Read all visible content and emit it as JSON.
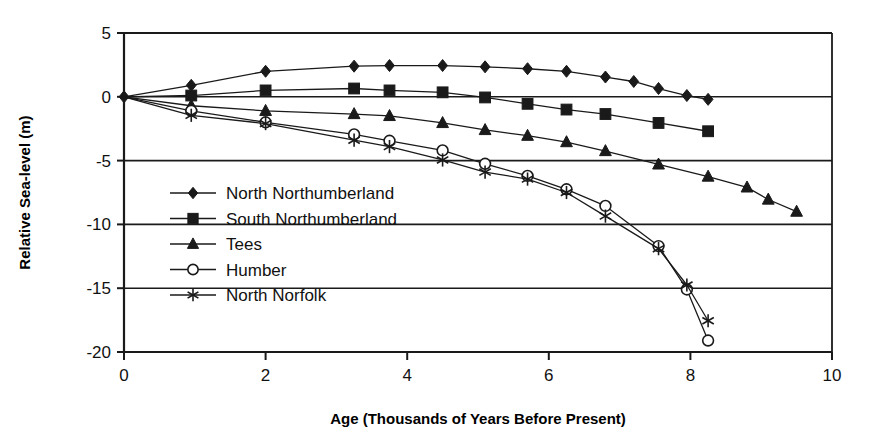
{
  "chart_data": {
    "type": "line",
    "title": "",
    "xlabel": "Age (Thousands of Years Before Present)",
    "ylabel": "Relative Sea-level (m)",
    "xlim": [
      0,
      10
    ],
    "ylim": [
      -20,
      5
    ],
    "xticks": [
      0,
      2,
      4,
      6,
      8,
      10
    ],
    "yticks": [
      5,
      0,
      -5,
      -10,
      -15,
      -20
    ],
    "xtick_labels": [
      "0",
      "2",
      "4",
      "6",
      "8",
      "10"
    ],
    "ytick_labels": [
      "5",
      "0",
      "-5",
      "-10",
      "-15",
      "-20"
    ],
    "grid": "horizontal",
    "legend_position": "inside-left",
    "series": [
      {
        "name": "North Northumberland",
        "marker": "filled-diamond",
        "points": [
          [
            0.0,
            0.0
          ],
          [
            0.95,
            0.9
          ],
          [
            2.0,
            2.0
          ],
          [
            3.25,
            2.4
          ],
          [
            3.75,
            2.45
          ],
          [
            4.5,
            2.45
          ],
          [
            5.1,
            2.35
          ],
          [
            5.7,
            2.2
          ],
          [
            6.25,
            2.0
          ],
          [
            6.8,
            1.55
          ],
          [
            7.2,
            1.2
          ],
          [
            7.55,
            0.65
          ],
          [
            7.95,
            0.1
          ],
          [
            8.25,
            -0.2
          ]
        ]
      },
      {
        "name": "South Northumberland",
        "marker": "filled-square",
        "points": [
          [
            0.0,
            0.0
          ],
          [
            0.95,
            0.1
          ],
          [
            2.0,
            0.5
          ],
          [
            3.25,
            0.65
          ],
          [
            3.75,
            0.5
          ],
          [
            4.5,
            0.35
          ],
          [
            5.1,
            -0.05
          ],
          [
            5.7,
            -0.55
          ],
          [
            6.25,
            -1.0
          ],
          [
            6.8,
            -1.35
          ],
          [
            7.55,
            -2.05
          ],
          [
            8.25,
            -2.7
          ]
        ]
      },
      {
        "name": "Tees",
        "marker": "filled-triangle",
        "points": [
          [
            0.0,
            0.0
          ],
          [
            0.95,
            -0.7
          ],
          [
            2.0,
            -1.1
          ],
          [
            3.25,
            -1.35
          ],
          [
            3.75,
            -1.5
          ],
          [
            4.5,
            -2.05
          ],
          [
            5.1,
            -2.6
          ],
          [
            5.7,
            -3.05
          ],
          [
            6.25,
            -3.55
          ],
          [
            6.8,
            -4.25
          ],
          [
            7.55,
            -5.3
          ],
          [
            8.25,
            -6.25
          ],
          [
            8.8,
            -7.1
          ],
          [
            9.1,
            -8.05
          ],
          [
            9.5,
            -9.0
          ]
        ]
      },
      {
        "name": "Humber",
        "marker": "open-circle",
        "points": [
          [
            0.0,
            0.0
          ],
          [
            0.95,
            -1.1
          ],
          [
            2.0,
            -2.0
          ],
          [
            3.25,
            -2.95
          ],
          [
            3.75,
            -3.45
          ],
          [
            4.5,
            -4.2
          ],
          [
            5.1,
            -5.25
          ],
          [
            5.7,
            -6.2
          ],
          [
            6.25,
            -7.25
          ],
          [
            6.8,
            -8.55
          ],
          [
            7.55,
            -11.7
          ],
          [
            7.95,
            -15.1
          ],
          [
            8.25,
            -19.1
          ]
        ]
      },
      {
        "name": "North Norfolk",
        "marker": "asterisk",
        "points": [
          [
            0.0,
            0.0
          ],
          [
            0.95,
            -1.45
          ],
          [
            2.0,
            -2.1
          ],
          [
            3.25,
            -3.4
          ],
          [
            3.75,
            -3.9
          ],
          [
            4.5,
            -4.95
          ],
          [
            5.1,
            -5.9
          ],
          [
            5.7,
            -6.45
          ],
          [
            6.25,
            -7.5
          ],
          [
            6.8,
            -9.35
          ],
          [
            7.55,
            -11.9
          ],
          [
            7.95,
            -14.75
          ],
          [
            8.25,
            -17.55
          ]
        ]
      }
    ]
  },
  "legend": {
    "items": [
      {
        "label": "North Northumberland",
        "marker": "filled-diamond"
      },
      {
        "label": "South Northumberland",
        "marker": "filled-square"
      },
      {
        "label": "Tees",
        "marker": "filled-triangle"
      },
      {
        "label": "Humber",
        "marker": "open-circle"
      },
      {
        "label": "North Norfolk",
        "marker": "asterisk"
      }
    ]
  },
  "colors": {
    "line": "#1a1a1a",
    "axis": "#1a1a1a",
    "text": "#111111",
    "background": "#ffffff"
  }
}
